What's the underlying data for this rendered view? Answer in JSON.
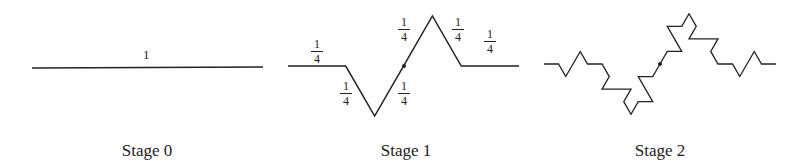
{
  "stages": [
    {
      "label": "Stage 0",
      "segment_label": "1"
    },
    {
      "label": "Stage 1",
      "fractions": [
        {
          "num": "1",
          "den": "4"
        },
        {
          "num": "1",
          "den": "4"
        },
        {
          "num": "1",
          "den": "4"
        },
        {
          "num": "1",
          "den": "4"
        },
        {
          "num": "1",
          "den": "4"
        },
        {
          "num": "1",
          "den": "4"
        }
      ]
    },
    {
      "label": "Stage 2"
    }
  ],
  "colors": {
    "line": "#222222",
    "background": "#ffffff"
  }
}
